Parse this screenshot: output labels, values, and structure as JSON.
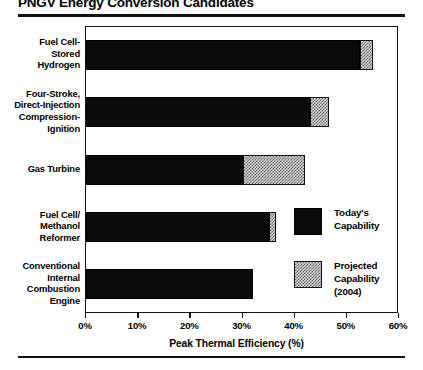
{
  "title": "PNGV Energy Conversion Candidates",
  "chart_data": {
    "type": "bar",
    "orientation": "horizontal",
    "title": "PNGV Energy Conversion Candidates",
    "xlabel": "Peak Thermal Efficiency (%)",
    "ylabel": "",
    "xlim": [
      0,
      60
    ],
    "xticks": [
      "0%",
      "10%",
      "20%",
      "30%",
      "40%",
      "50%",
      "60%"
    ],
    "xtick_values": [
      0,
      10,
      20,
      30,
      40,
      50,
      60
    ],
    "grid": false,
    "stacked": true,
    "categories": [
      "Fuel Cell-Stored Hydrogen",
      "Four-Stroke, Direct-Injection Compression-Ignition",
      "Gas Turbine",
      "Fuel Cell/Methanol Reformer",
      "Conventional Internal Combustion Engine"
    ],
    "category_lines": [
      [
        "Fuel Cell-",
        "Stored",
        "Hydrogen"
      ],
      [
        "Four-Stroke,",
        "Direct-Injection",
        "Compression-",
        "Ignition"
      ],
      [
        "Gas Turbine"
      ],
      [
        "Fuel Cell/",
        "Methanol",
        "Reformer"
      ],
      [
        "Conventional",
        "Internal",
        "Combustion",
        "Engine"
      ]
    ],
    "series": [
      {
        "name": "Today's Capability",
        "values": [
          52.5,
          43.0,
          30.0,
          35.0,
          32.0
        ]
      },
      {
        "name": "Projected Capability (2004)",
        "values": [
          55.0,
          46.5,
          42.0,
          36.5,
          32.0
        ]
      }
    ],
    "legend": [
      {
        "label_lines": [
          "Today's",
          "Capability"
        ],
        "swatch": "solid-black"
      },
      {
        "label_lines": [
          "Projected",
          "Capability",
          "(2004)"
        ],
        "swatch": "hatched-gray"
      }
    ],
    "legend_position": "inside-right",
    "colors": {
      "today": "#0b0b0b",
      "projected": "#cfcfcf",
      "axis": "#111111",
      "background": "#ffffff"
    }
  }
}
